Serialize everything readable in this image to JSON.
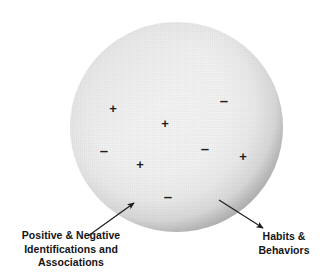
{
  "diagram": {
    "colors": {
      "sphere_fill": "#f2f2f2",
      "sphere_rim": "#b2b2b2",
      "marker": "#1d1d1d",
      "text": "#141414",
      "arrow": "#1d1d1d",
      "background": "#ffffff"
    },
    "sphere": {
      "name": "main-sphere",
      "center_x": 176,
      "center_y": 127,
      "diameter": 213
    },
    "markers": [
      {
        "sign": "+",
        "x": 113,
        "y": 108
      },
      {
        "sign": "–",
        "x": 224,
        "y": 100
      },
      {
        "sign": "+",
        "x": 165,
        "y": 123
      },
      {
        "sign": "–",
        "x": 104,
        "y": 150
      },
      {
        "sign": "–",
        "x": 205,
        "y": 148
      },
      {
        "sign": "+",
        "x": 243,
        "y": 156
      },
      {
        "sign": "+",
        "x": 140,
        "y": 164
      },
      {
        "sign": "–",
        "x": 168,
        "y": 196
      }
    ],
    "arrows": [
      {
        "name": "arrow-positive-negative",
        "from_x": 88,
        "from_y": 236,
        "to_x": 134,
        "to_y": 203
      },
      {
        "name": "arrow-habits-behaviors",
        "from_x": 219,
        "from_y": 200,
        "to_x": 263,
        "to_y": 228
      }
    ],
    "labels": {
      "left": "Positive & Negative\nIdentifications and\nAssociations",
      "right": "Habits &\nBehaviors"
    }
  }
}
